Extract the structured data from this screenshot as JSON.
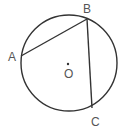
{
  "diagram": {
    "type": "circle-geometry",
    "colors": {
      "stroke": "#333333",
      "label": "#555555",
      "background": "#ffffff"
    },
    "circle": {
      "center": "O",
      "cx": 69,
      "cy": 63,
      "r": 48
    },
    "points": [
      {
        "name": "A",
        "x": 21,
        "y": 56,
        "label": "A",
        "lx": 8,
        "ly": 61
      },
      {
        "name": "B",
        "x": 87,
        "y": 19,
        "label": "B",
        "lx": 83,
        "ly": 13
      },
      {
        "name": "C",
        "x": 92,
        "y": 108,
        "label": "C",
        "lx": 91,
        "ly": 126
      },
      {
        "name": "O",
        "x": 68,
        "y": 64,
        "label": "O",
        "lx": 64,
        "ly": 78
      }
    ],
    "segments": [
      {
        "from": "A",
        "to": "B"
      },
      {
        "from": "B",
        "to": "C"
      }
    ]
  }
}
